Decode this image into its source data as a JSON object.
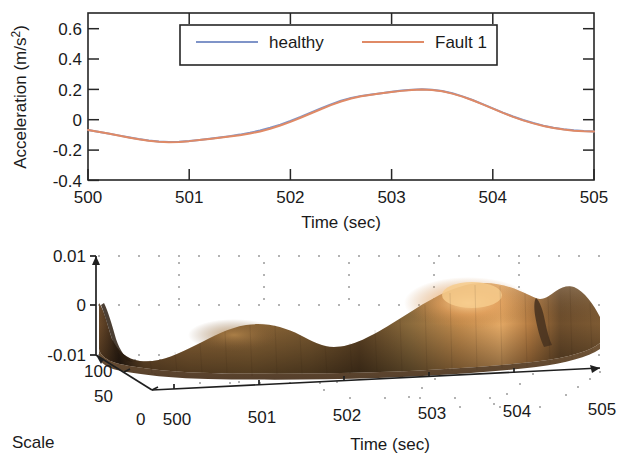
{
  "figure": {
    "background_color": "#ffffff",
    "panels": [
      "signal-time-series",
      "wavelet-surface-3d"
    ]
  },
  "chart_data": [
    {
      "type": "line",
      "id": "acceleration-vs-time",
      "title": "",
      "xlabel": "Time (sec)",
      "ylabel": "Acceleration (m/s²)",
      "ylabel_base": "Acceleration (m/s",
      "ylabel_sup": "2",
      "ylabel_tail": ")",
      "xlim": [
        500,
        505
      ],
      "ylim": [
        -0.4,
        0.7
      ],
      "xticks": [
        500,
        501,
        502,
        503,
        504,
        505
      ],
      "xtick_labels": [
        "500",
        "501",
        "502",
        "503",
        "504",
        "505"
      ],
      "yticks": [
        0.6,
        0.4,
        0.2,
        0,
        -0.2,
        -0.4
      ],
      "ytick_labels": [
        "0.6",
        "0.4",
        "0.2",
        "0",
        "-0.2",
        "-0.4"
      ],
      "grid": false,
      "legend_position": "top-center",
      "series": [
        {
          "name": "healthy",
          "color": "#7f94c8",
          "x": [
            500.0,
            500.1,
            500.2,
            500.3,
            500.4,
            500.5,
            500.6,
            500.7,
            500.8,
            500.9,
            501.0,
            501.1,
            501.2,
            501.3,
            501.4,
            501.5,
            501.6,
            501.7,
            501.8,
            501.9,
            502.0,
            502.1,
            502.2,
            502.3,
            502.4,
            502.5,
            502.6,
            502.7,
            502.8,
            502.9,
            503.0,
            503.1,
            503.2,
            503.3,
            503.4,
            503.5,
            503.6,
            503.7,
            503.8,
            503.9,
            504.0,
            504.1,
            504.2,
            504.3,
            504.4,
            504.5,
            504.6,
            504.7,
            504.8,
            504.9,
            505.0
          ],
          "values": [
            -0.07,
            -0.082,
            -0.094,
            -0.106,
            -0.118,
            -0.13,
            -0.14,
            -0.147,
            -0.15,
            -0.148,
            -0.143,
            -0.136,
            -0.128,
            -0.12,
            -0.111,
            -0.101,
            -0.089,
            -0.074,
            -0.056,
            -0.035,
            -0.011,
            0.015,
            0.043,
            0.071,
            0.098,
            0.122,
            0.141,
            0.154,
            0.163,
            0.172,
            0.181,
            0.189,
            0.195,
            0.198,
            0.195,
            0.186,
            0.171,
            0.151,
            0.127,
            0.1,
            0.072,
            0.044,
            0.018,
            -0.005,
            -0.025,
            -0.042,
            -0.056,
            -0.066,
            -0.073,
            -0.078,
            -0.08
          ]
        },
        {
          "name": "Fault 1",
          "color": "#e08a66",
          "x": [
            500.0,
            500.1,
            500.2,
            500.3,
            500.4,
            500.5,
            500.6,
            500.7,
            500.8,
            500.9,
            501.0,
            501.1,
            501.2,
            501.3,
            501.4,
            501.5,
            501.6,
            501.7,
            501.8,
            501.9,
            502.0,
            502.1,
            502.2,
            502.3,
            502.4,
            502.5,
            502.6,
            502.7,
            502.8,
            502.9,
            503.0,
            503.1,
            503.2,
            503.3,
            503.4,
            503.5,
            503.6,
            503.7,
            503.8,
            503.9,
            504.0,
            504.1,
            504.2,
            504.3,
            504.4,
            504.5,
            504.6,
            504.7,
            504.8,
            504.9,
            505.0
          ],
          "values": [
            -0.07,
            -0.082,
            -0.094,
            -0.107,
            -0.12,
            -0.132,
            -0.142,
            -0.148,
            -0.151,
            -0.149,
            -0.144,
            -0.137,
            -0.13,
            -0.122,
            -0.114,
            -0.105,
            -0.094,
            -0.08,
            -0.062,
            -0.041,
            -0.017,
            0.01,
            0.038,
            0.066,
            0.093,
            0.117,
            0.137,
            0.152,
            0.162,
            0.171,
            0.18,
            0.187,
            0.193,
            0.196,
            0.193,
            0.184,
            0.169,
            0.149,
            0.125,
            0.098,
            0.07,
            0.042,
            0.016,
            -0.007,
            -0.027,
            -0.044,
            -0.058,
            -0.068,
            -0.075,
            -0.079,
            -0.081
          ]
        }
      ],
      "series_offsets_note": "Fault 1 peak slightly higher near 502.7 and trough slightly lower near 504.3",
      "legend": [
        {
          "label": "healthy",
          "color": "#7f94c8"
        },
        {
          "label": "Fault 1",
          "color": "#e08a66"
        }
      ]
    },
    {
      "type": "surface",
      "id": "wavelet-coefficients-3d",
      "title": "",
      "xlabel": "Time (sec)",
      "ylabel": "Scale",
      "zlabel": "",
      "xlim": [
        500,
        505
      ],
      "ylim": [
        0,
        100
      ],
      "zlim": [
        -0.01,
        0.01
      ],
      "xticks": [
        500,
        501,
        502,
        503,
        504,
        505
      ],
      "xtick_labels": [
        "500",
        "501",
        "502",
        "503",
        "504",
        "505"
      ],
      "yticks": [
        0,
        50,
        100
      ],
      "ytick_labels": [
        "0",
        "50",
        "100"
      ],
      "zticks": [
        0.01,
        0,
        -0.01
      ],
      "ztick_labels": [
        "0.01",
        "0",
        "-0.01"
      ],
      "grid": true,
      "grid_style": "dotted",
      "colormap": "copper",
      "surface_colors": {
        "low": "#3a2a1c",
        "mid": "#8a6234",
        "high": "#d99a55",
        "peak": "#f2c182"
      },
      "features": [
        {
          "name": "ridge-left",
          "time": 500.1,
          "height": "low-negative"
        },
        {
          "name": "bump-mid-left",
          "time": 501.1,
          "height": "small"
        },
        {
          "name": "main-peak",
          "time": 503.1,
          "height": "large-positive"
        },
        {
          "name": "step-drop",
          "time": 504.3,
          "height": "cliff"
        }
      ]
    }
  ]
}
